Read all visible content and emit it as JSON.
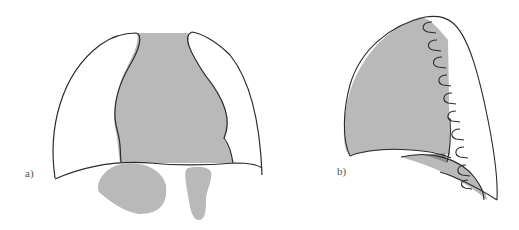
{
  "figure": {
    "panels": [
      {
        "id": "a",
        "label": "a)",
        "description": "Frontal view of thorax: lungs with shaded mediastinum and shaded abdominal organs below diaphragm"
      },
      {
        "id": "b",
        "label": "b)",
        "description": "Lateral view of lung with shaded region, ribs along chest wall and shaded diaphragm region"
      }
    ],
    "colors": {
      "outline": "#2a2a2a",
      "shade": "#b9b9b9",
      "shade_dark": "#8f8f8f",
      "background": "#ffffff"
    }
  }
}
